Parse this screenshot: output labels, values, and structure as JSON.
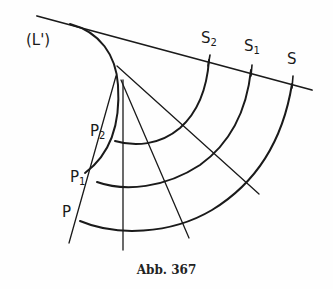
{
  "figure": {
    "caption": "Abb. 367",
    "labels": {
      "evolute": "(L')",
      "S": "S",
      "S1_base": "S",
      "S1_sub": "1",
      "S2_base": "S",
      "S2_sub": "2",
      "P": "P",
      "P1_base": "P",
      "P1_sub": "1",
      "P2_base": "P",
      "P2_sub": "2"
    },
    "stroke_color": "#1a1a1a",
    "background": "#fefefe"
  }
}
